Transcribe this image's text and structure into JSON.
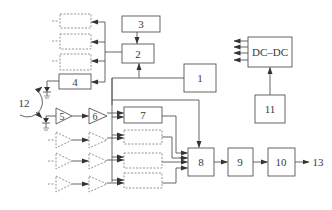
{
  "diagram": {
    "type": "block-diagram",
    "colors": {
      "line": "#555555",
      "dashed": "#888888",
      "background": "#ffffff",
      "text": "#3a3a3a"
    },
    "blocks": [
      {
        "id": "1",
        "label": "1"
      },
      {
        "id": "2",
        "label": "2"
      },
      {
        "id": "3",
        "label": "3"
      },
      {
        "id": "4",
        "label": "4"
      },
      {
        "id": "5",
        "label": "5"
      },
      {
        "id": "6",
        "label": "6"
      },
      {
        "id": "7",
        "label": "7"
      },
      {
        "id": "8",
        "label": "8"
      },
      {
        "id": "9",
        "label": "9"
      },
      {
        "id": "10",
        "label": "10"
      },
      {
        "id": "11",
        "label": "11"
      },
      {
        "id": "dcdc",
        "label": "DC–DC"
      }
    ],
    "labels": {
      "source": "12",
      "output": "13"
    },
    "connections": [
      "3 -> 2",
      "1 -> 2",
      "2 -> 4",
      "2 -> dashed blocks (x3)",
      "5 -> 6",
      "6 -> 7",
      "7 -> 8",
      "1 -> 8",
      "8 -> 9",
      "9 -> 10",
      "10 -> 13",
      "11 -> DC-DC",
      "DC-DC -> outputs (x4)"
    ]
  }
}
